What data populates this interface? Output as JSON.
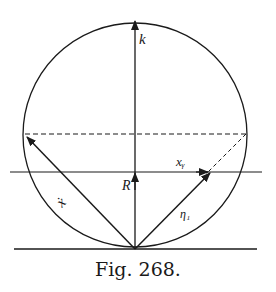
{
  "figure": {
    "caption": "Fig. 268.",
    "labels": {
      "top": "k",
      "center": "R",
      "horizontal": "xᵧ",
      "left_vector": "ẋ",
      "right_vector": "η₁"
    },
    "colors": {
      "ink": "#1a1a1a",
      "background": "#ffffff"
    }
  }
}
